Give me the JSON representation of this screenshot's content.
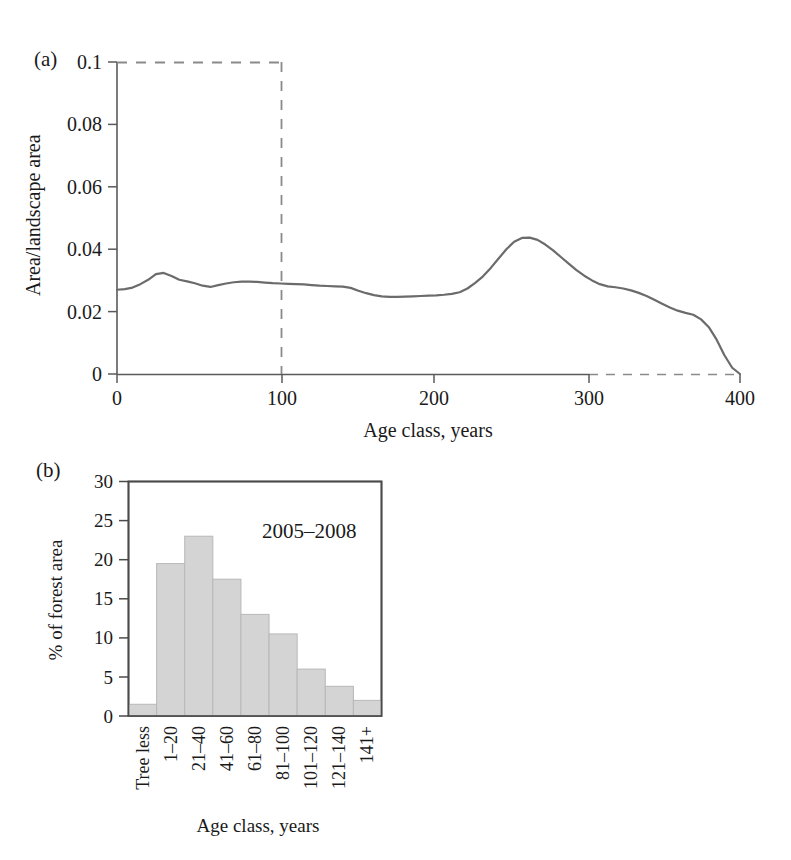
{
  "figure": {
    "panel_a_label": "(a)",
    "panel_b_label": "(b)"
  },
  "colors": {
    "line": "#6b6b6b",
    "axis": "#5a5a5a",
    "dashed": "#8a8a8a",
    "bar_fill": "#d4d4d4",
    "bar_edge": "#b8b8b8",
    "text": "#1a1a1a",
    "frame": "#4a4a4a"
  },
  "chart_data": [
    {
      "id": "panel-a",
      "type": "line",
      "title": "",
      "xlabel": "Age class, years",
      "ylabel": "Area/landscape area",
      "xlim": [
        0,
        400
      ],
      "ylim": [
        0,
        0.1
      ],
      "xticks": [
        0,
        100,
        200,
        300,
        400
      ],
      "xtick_labels": [
        "0",
        "100",
        "200",
        "300",
        "400"
      ],
      "yticks": [
        0,
        0.02,
        0.04,
        0.06,
        0.08,
        0.1
      ],
      "ytick_labels": [
        "0",
        "0.02",
        "0.04",
        "0.06",
        "0.08",
        "0.1"
      ],
      "grid": false,
      "legend": "none",
      "annotations": [
        {
          "name": "dashed-reference-box",
          "kind": "dashed-rectangle",
          "x0": 0,
          "x1": 100,
          "y0": 0,
          "y1": 0.1
        },
        {
          "name": "dashed-baseline-segment",
          "kind": "dashed-horizontal",
          "x0": 300,
          "x1": 400,
          "y": 0
        }
      ],
      "series": [
        {
          "name": "Area/landscape area by age class",
          "x": [
            0,
            5,
            10,
            15,
            20,
            25,
            30,
            35,
            40,
            45,
            50,
            55,
            60,
            65,
            70,
            75,
            80,
            85,
            90,
            95,
            100,
            105,
            110,
            115,
            120,
            125,
            130,
            135,
            140,
            145,
            150,
            155,
            160,
            165,
            170,
            175,
            180,
            185,
            190,
            195,
            200,
            205,
            210,
            215,
            220,
            225,
            230,
            235,
            240,
            245,
            250,
            255,
            260,
            265,
            270,
            275,
            280,
            285,
            290,
            295,
            300,
            305,
            310,
            315,
            320,
            325,
            330,
            335,
            340,
            345,
            350,
            355,
            360,
            365,
            370,
            375,
            380,
            385,
            390,
            395,
            400
          ],
          "y": [
            0.027,
            0.0272,
            0.0277,
            0.0288,
            0.0302,
            0.032,
            0.0324,
            0.0314,
            0.0302,
            0.0297,
            0.0291,
            0.0283,
            0.0279,
            0.0285,
            0.029,
            0.0294,
            0.0296,
            0.0296,
            0.0295,
            0.0293,
            0.0291,
            0.029,
            0.0289,
            0.0288,
            0.0287,
            0.0285,
            0.0283,
            0.0282,
            0.0281,
            0.028,
            0.0276,
            0.0267,
            0.0259,
            0.0253,
            0.0249,
            0.0247,
            0.0247,
            0.0248,
            0.0249,
            0.025,
            0.0251,
            0.0252,
            0.0254,
            0.0257,
            0.0262,
            0.0274,
            0.0292,
            0.0313,
            0.034,
            0.037,
            0.04,
            0.0424,
            0.0436,
            0.0437,
            0.043,
            0.0415,
            0.0396,
            0.0375,
            0.0354,
            0.0333,
            0.0315,
            0.03,
            0.0288,
            0.0281,
            0.0278,
            0.0274,
            0.0268,
            0.026,
            0.025,
            0.0238,
            0.0225,
            0.0213,
            0.0203,
            0.0196,
            0.019,
            0.0175,
            0.015,
            0.011,
            0.006,
            0.002,
            0.0
          ]
        }
      ]
    },
    {
      "id": "panel-b",
      "type": "bar",
      "title": "",
      "xlabel": "Age class, years",
      "ylabel": "% of forest area",
      "categories": [
        "Tree less",
        "1–20",
        "21–40",
        "41–60",
        "61–80",
        "81–100",
        "101–120",
        "121–140",
        "141+"
      ],
      "values": [
        1.5,
        19.5,
        23.0,
        17.5,
        13.0,
        10.5,
        6.0,
        3.8,
        2.0
      ],
      "ylim": [
        0,
        30
      ],
      "yticks": [
        0,
        5,
        10,
        15,
        20,
        25,
        30
      ],
      "ytick_labels": [
        "0",
        "5",
        "10",
        "15",
        "20",
        "25",
        "30"
      ],
      "grid": false,
      "legend": "none",
      "annotations": [
        {
          "name": "period-annotation",
          "kind": "text",
          "text": "2005–2008",
          "x_category_index": 5,
          "y": 24.5
        }
      ]
    }
  ]
}
